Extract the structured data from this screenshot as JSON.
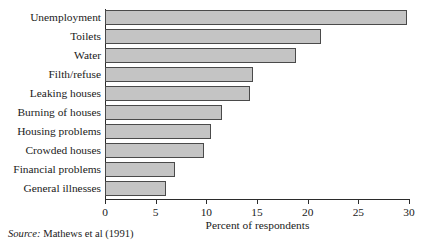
{
  "chart_data": {
    "type": "bar",
    "orientation": "horizontal",
    "title": "",
    "xlabel": "Percent of respondents",
    "ylabel": "",
    "xlim": [
      0,
      30
    ],
    "xticks": [
      0,
      5,
      10,
      15,
      20,
      25,
      30
    ],
    "xtick_labels": [
      "0",
      "5",
      "10",
      "15",
      "20",
      "25",
      "30"
    ],
    "grid": false,
    "legend": null,
    "categories": [
      "Unemployment",
      "Toilets",
      "Water",
      "Filth/refuse",
      "Leaking houses",
      "Burning of houses",
      "Housing problems",
      "Crowded houses",
      "Financial problems",
      "General illnesses"
    ],
    "values": [
      29.8,
      21.3,
      18.8,
      14.6,
      14.3,
      11.5,
      10.5,
      9.8,
      6.9,
      6.0
    ],
    "bar_fill_color": "#c4c4c4",
    "bar_edge_color": "#4a4a4a",
    "axis_color": "#2b2b2b"
  },
  "source": {
    "keyword": "Source:",
    "text": "Mathews et al (1991)"
  }
}
